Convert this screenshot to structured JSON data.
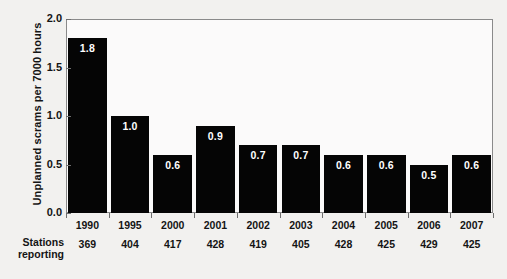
{
  "chart_data": {
    "type": "bar",
    "title": "",
    "xlabel": "",
    "ylabel": "Unplanned scrams per 7000 hours",
    "ylim": [
      0.0,
      2.0
    ],
    "yticks": [
      "0.0",
      "0.5",
      "1.0",
      "1.5",
      "2.0"
    ],
    "grid": false,
    "legend": null,
    "bar_color": "#050505",
    "value_label_color": "#ffffff",
    "categories": [
      "1990",
      "1995",
      "2000",
      "2001",
      "2002",
      "2003",
      "2004",
      "2005",
      "2006",
      "2007"
    ],
    "values": [
      1.8,
      1.0,
      0.6,
      0.9,
      0.7,
      0.7,
      0.6,
      0.6,
      0.5,
      0.6
    ],
    "value_labels": [
      "1.8",
      "1.0",
      "0.6",
      "0.9",
      "0.7",
      "0.7",
      "0.6",
      "0.6",
      "0.5",
      "0.6"
    ],
    "secondary_row": {
      "label_line1": "Stations",
      "label_line2": "reporting",
      "values": [
        "369",
        "404",
        "417",
        "428",
        "419",
        "405",
        "428",
        "425",
        "429",
        "425"
      ]
    }
  }
}
